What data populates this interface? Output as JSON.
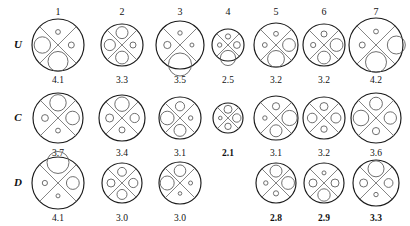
{
  "figure": {
    "title": "",
    "row_labels": [
      "U",
      "C",
      "D"
    ],
    "column_headers": [
      "1",
      "2",
      "3",
      "4",
      "5",
      "6",
      "7"
    ],
    "glyph_description": "circle divided by an X into four quadrants (top, left, right, bottom), each quadrant holding a circle whose radius encodes a value"
  },
  "chart_data": {
    "type": "table",
    "title": "",
    "xlabel": "",
    "ylabel": "",
    "categories": [
      "1",
      "2",
      "3",
      "4",
      "5",
      "6",
      "7"
    ],
    "rows": [
      "U",
      "C",
      "D"
    ],
    "series": [
      {
        "name": "U",
        "values": [
          4.1,
          3.3,
          3.5,
          2.5,
          3.2,
          3.2,
          4.2
        ]
      },
      {
        "name": "C",
        "values": [
          3.7,
          3.4,
          3.1,
          2.1,
          3.1,
          3.2,
          3.6
        ]
      },
      {
        "name": "D",
        "values": [
          4.1,
          3.0,
          3.0,
          null,
          2.8,
          2.9,
          3.3
        ]
      }
    ]
  },
  "cells": [
    {
      "row": "U",
      "col": "1",
      "value": "4.1",
      "bold": false,
      "present": true,
      "outer_r": 26,
      "quadrants": {
        "top": 2.4,
        "left": 8.2,
        "right": 3.0,
        "bottom": 10.0
      },
      "overflow": "none"
    },
    {
      "row": "U",
      "col": "2",
      "value": "3.3",
      "bold": false,
      "present": true,
      "outer_r": 21,
      "quadrants": {
        "top": 6.0,
        "left": 5.6,
        "right": 3.0,
        "bottom": 6.4
      },
      "overflow": "none"
    },
    {
      "row": "U",
      "col": "3",
      "value": "3.5",
      "bold": false,
      "present": true,
      "outer_r": 24,
      "quadrants": {
        "top": 2.2,
        "left": 3.6,
        "right": 2.0,
        "bottom": 11.5
      },
      "overflow": "bottom"
    },
    {
      "row": "U",
      "col": "4",
      "value": "2.5",
      "bold": false,
      "present": true,
      "outer_r": 16,
      "quadrants": {
        "top": 2.6,
        "left": 2.2,
        "right": 3.4,
        "bottom": 7.6
      },
      "overflow": "bottom"
    },
    {
      "row": "U",
      "col": "5",
      "value": "3.2",
      "bold": false,
      "present": true,
      "outer_r": 22,
      "quadrants": {
        "top": 2.4,
        "left": 2.4,
        "right": 6.4,
        "bottom": 8.4
      },
      "overflow": "none"
    },
    {
      "row": "U",
      "col": "6",
      "value": "3.2",
      "bold": false,
      "present": true,
      "outer_r": 21,
      "quadrants": {
        "top": 3.0,
        "left": 2.6,
        "right": 6.4,
        "bottom": 6.4
      },
      "overflow": "none"
    },
    {
      "row": "U",
      "col": "7",
      "value": "4.2",
      "bold": false,
      "present": true,
      "outer_r": 27,
      "quadrants": {
        "top": 2.4,
        "left": 3.0,
        "right": 9.0,
        "bottom": 10.5
      },
      "overflow": "right"
    },
    {
      "row": "C",
      "col": "1",
      "value": "3.7",
      "bold": false,
      "present": true,
      "outer_r": 25,
      "quadrants": {
        "top": 8.2,
        "left": 3.4,
        "right": 6.8,
        "bottom": 2.4
      },
      "overflow": "none"
    },
    {
      "row": "C",
      "col": "2",
      "value": "3.4",
      "bold": false,
      "present": true,
      "outer_r": 23,
      "quadrants": {
        "top": 7.2,
        "left": 4.0,
        "right": 4.6,
        "bottom": 3.0
      },
      "overflow": "none"
    },
    {
      "row": "C",
      "col": "3",
      "value": "3.1",
      "bold": false,
      "present": true,
      "outer_r": 21,
      "quadrants": {
        "top": 4.6,
        "left": 6.8,
        "right": 2.2,
        "bottom": 6.0
      },
      "overflow": "none"
    },
    {
      "row": "C",
      "col": "4",
      "value": "2.1",
      "bold": true,
      "present": true,
      "outer_r": 15,
      "quadrants": {
        "top": 4.0,
        "left": 1.8,
        "right": 4.2,
        "bottom": 3.2
      },
      "overflow": "none"
    },
    {
      "row": "C",
      "col": "5",
      "value": "3.1",
      "bold": false,
      "present": true,
      "outer_r": 22,
      "quadrants": {
        "top": 3.6,
        "left": 2.2,
        "right": 7.6,
        "bottom": 6.0
      },
      "overflow": "none"
    },
    {
      "row": "C",
      "col": "6",
      "value": "3.2",
      "bold": false,
      "present": true,
      "outer_r": 21,
      "quadrants": {
        "top": 4.0,
        "left": 4.8,
        "right": 5.0,
        "bottom": 3.2
      },
      "overflow": "none"
    },
    {
      "row": "C",
      "col": "7",
      "value": "3.6",
      "bold": false,
      "present": true,
      "outer_r": 25,
      "quadrants": {
        "top": 6.4,
        "left": 7.8,
        "right": 6.2,
        "bottom": 3.6
      },
      "overflow": "none"
    },
    {
      "row": "D",
      "col": "1",
      "value": "4.1",
      "bold": false,
      "present": true,
      "outer_r": 26,
      "quadrants": {
        "top": 11.0,
        "left": 2.6,
        "right": 6.4,
        "bottom": 2.0
      },
      "overflow": "top"
    },
    {
      "row": "D",
      "col": "2",
      "value": "3.0",
      "bold": false,
      "present": true,
      "outer_r": 20,
      "quadrants": {
        "top": 4.4,
        "left": 4.0,
        "right": 4.6,
        "bottom": 5.0
      },
      "overflow": "none"
    },
    {
      "row": "D",
      "col": "3",
      "value": "3.0",
      "bold": false,
      "present": true,
      "outer_r": 21,
      "quadrants": {
        "top": 5.8,
        "left": 7.0,
        "right": 2.0,
        "bottom": 1.8
      },
      "overflow": "none"
    },
    {
      "row": "D",
      "col": "4",
      "value": "",
      "bold": false,
      "present": false,
      "outer_r": 0,
      "quadrants": {
        "top": 0,
        "left": 0,
        "right": 0,
        "bottom": 0
      },
      "overflow": "none"
    },
    {
      "row": "D",
      "col": "5",
      "value": "2.8",
      "bold": true,
      "present": true,
      "outer_r": 20,
      "quadrants": {
        "top": 6.0,
        "left": 2.2,
        "right": 6.4,
        "bottom": 2.6
      },
      "overflow": "none"
    },
    {
      "row": "D",
      "col": "6",
      "value": "2.9",
      "bold": true,
      "present": true,
      "outer_r": 20,
      "quadrants": {
        "top": 2.0,
        "left": 4.0,
        "right": 4.0,
        "bottom": 6.2
      },
      "overflow": "none"
    },
    {
      "row": "D",
      "col": "7",
      "value": "3.3",
      "bold": true,
      "present": true,
      "outer_r": 23,
      "quadrants": {
        "top": 8.0,
        "left": 4.0,
        "right": 4.4,
        "bottom": 2.2
      },
      "overflow": "none"
    }
  ],
  "layout": {
    "column_x": [
      58,
      122,
      180,
      228,
      276,
      324,
      376
    ],
    "header_y": 6,
    "row_center_y": [
      45,
      118,
      183
    ],
    "row_label_x": [
      10,
      10,
      10
    ],
    "value_dy": 30
  },
  "colors": {
    "ink": "#1a1a1a",
    "spoke": "#6f6f6f",
    "inner": "#5f5f5f",
    "background": "#ffffff"
  }
}
